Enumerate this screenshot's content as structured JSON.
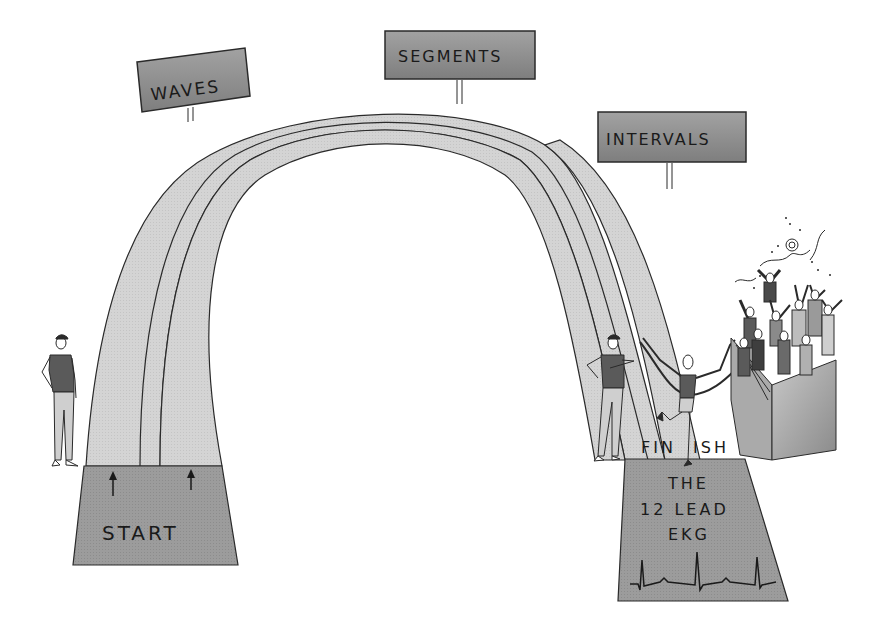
{
  "signs": {
    "waves": "WAVES",
    "segments": "SEGMENTS",
    "intervals": "INTERVALS"
  },
  "start_pad": {
    "label": "START",
    "arrows": [
      "up-arrow",
      "up-arrow"
    ]
  },
  "finish_line": {
    "label_left": "FIN",
    "label_right": "ISH"
  },
  "finish_pad": {
    "line1": "THE",
    "line2": "12 LEAD",
    "line3": "EKG",
    "waveform": "ekg-tracing"
  },
  "figures": {
    "start_official": "standing-man",
    "finish_official": "standing-man-pointing",
    "runner": "runner-breaking-tape",
    "crowd": "cheering-crowd-in-bleachers"
  },
  "colors": {
    "sign_fill": "#8f8f8f",
    "track_light": "#d6d6d6",
    "pad_dark": "#9a9a9a",
    "outline": "#2a2a2a",
    "shirt": "#5a5a5a",
    "pants": "#cfcfcf"
  }
}
